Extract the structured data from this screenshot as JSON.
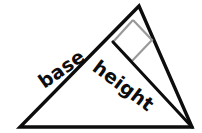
{
  "figure": {
    "background_color": "#ffffff",
    "stroke_color": "#0d0d0d",
    "marker_color": "#9a9a9a",
    "width": 202,
    "height": 133
  },
  "labels": {
    "base": "base",
    "height": "height"
  },
  "geometry": {
    "vertices": {
      "apex": [
        139,
        6
      ],
      "bottom_left": [
        20,
        127
      ],
      "bottom_right": [
        192,
        127
      ]
    },
    "height_segment": {
      "from": [
        113,
        42
      ],
      "to": [
        192,
        127
      ]
    },
    "right_angle_marker": {
      "corner": [
        113,
        42
      ],
      "arm_a": [
        133,
        20
      ],
      "far": [
        152,
        40
      ],
      "arm_b": [
        132,
        61
      ]
    }
  }
}
